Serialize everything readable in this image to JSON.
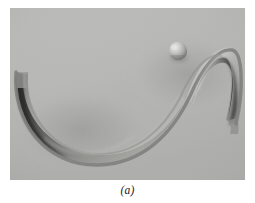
{
  "figure": {
    "caption": "(a)",
    "plate": {
      "kind": "photograph",
      "subject": "s-shaped-curved-track-with-ball",
      "background_color": "#b6b6b4",
      "left": 10,
      "top": 8,
      "width": 235,
      "height": 172
    },
    "objects": [
      {
        "name": "sigmoid-track-ribbon",
        "description": "S-shaped curved ribbon surface: left half concave-up (valley), right half concave-down (hill)",
        "edge_color": "#8a8a88",
        "surface_light": "#c6c6c3",
        "surface_dark": "#2e2e2c"
      },
      {
        "name": "ball",
        "description": "small sphere resting on the upper-right concave-down section of the track",
        "center_x": 178,
        "center_y": 51,
        "radius": 9,
        "highlight_color": "#dcdcd8",
        "shade_color": "#70706e"
      }
    ],
    "colors": {
      "page": "#ffffff",
      "plate_background": "#b6b6b4",
      "track_edge": "#8a8a88",
      "track_shadow": "#2e2e2c",
      "track_highlight": "#cfcfcc",
      "caption_text": "#1a1a1a"
    }
  }
}
